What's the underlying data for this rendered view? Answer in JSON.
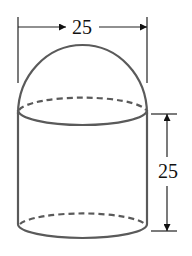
{
  "figure": {
    "width_label": "25",
    "height_label": "25",
    "colors": {
      "outline": "#5a5a5a",
      "dimension": "#222222",
      "background": "#ffffff"
    }
  }
}
